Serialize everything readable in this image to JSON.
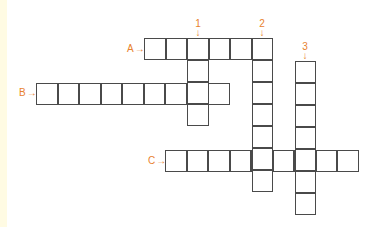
{
  "puzzle": {
    "accent_color": "#e8822e",
    "across": [
      {
        "label": "A",
        "cells": 6
      },
      {
        "label": "B",
        "cells": 9
      },
      {
        "label": "C",
        "cells": 9
      }
    ],
    "down": [
      {
        "label": "1",
        "cells": 4
      },
      {
        "label": "2",
        "cells": 7
      },
      {
        "label": "3",
        "cells": 7
      }
    ]
  }
}
